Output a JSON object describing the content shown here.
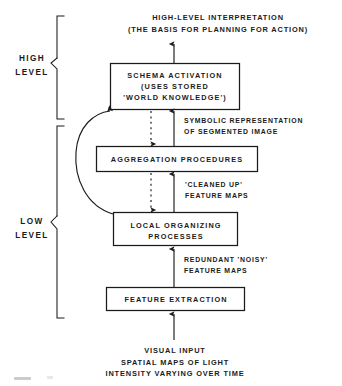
{
  "figure": {
    "type": "block-diagram",
    "orientation": "bottom-up-processing-hierarchy",
    "background_color": "#ffffff",
    "ink_color": "#1b1b1b"
  },
  "levels": [
    {
      "id": "high",
      "label_line1": "HIGH",
      "label_line2": "LEVEL"
    },
    {
      "id": "low",
      "label_line1": "LOW",
      "label_line2": "LEVEL"
    }
  ],
  "top_annotation": {
    "line1": "HIGH-LEVEL INTERPRETATION",
    "line2": "(THE BASIS FOR PLANNING FOR ACTION)"
  },
  "bottom_annotation": {
    "line1": "VISUAL INPUT",
    "line2": "SPATIAL MAPS OF LIGHT",
    "line3": "INTENSITY VARYING OVER TIME"
  },
  "boxes": [
    {
      "id": "schema-activation",
      "line1": "SCHEMA ACTIVATION",
      "line2": "(USES STORED",
      "line3": "'WORLD KNOWLEDGE')"
    },
    {
      "id": "aggregation-procedures",
      "line1": "AGGREGATION PROCEDURES"
    },
    {
      "id": "local-organizing-processes",
      "line1": "LOCAL ORGANIZING",
      "line2": "PROCESSES"
    },
    {
      "id": "feature-extraction",
      "line1": "FEATURE EXTRACTION"
    }
  ],
  "edge_labels": [
    {
      "id": "symbolic-representation",
      "line1": "SYMBOLIC REPRESENTATION",
      "line2": "OF SEGMENTED IMAGE"
    },
    {
      "id": "cleaned-up-feature-maps",
      "line1": "'CLEANED UP'",
      "line2": "FEATURE MAPS"
    },
    {
      "id": "redundant-noisy-feature-maps",
      "line1": "REDUNDANT 'NOISY'",
      "line2": "FEATURE MAPS"
    }
  ],
  "arrows": [
    {
      "id": "schema-to-interpretation",
      "style": "solid",
      "direction": "up"
    },
    {
      "id": "aggregation-to-schema",
      "style": "solid",
      "direction": "up"
    },
    {
      "id": "schema-to-aggregation",
      "style": "dashed",
      "direction": "down"
    },
    {
      "id": "local-to-aggregation",
      "style": "solid",
      "direction": "up"
    },
    {
      "id": "aggregation-to-local",
      "style": "dashed",
      "direction": "down"
    },
    {
      "id": "feature-to-local",
      "style": "solid",
      "direction": "up"
    },
    {
      "id": "input-to-feature",
      "style": "solid",
      "direction": "up"
    },
    {
      "id": "local-feedback-to-schema",
      "style": "solid-curved",
      "direction": "up-left-curve"
    }
  ]
}
